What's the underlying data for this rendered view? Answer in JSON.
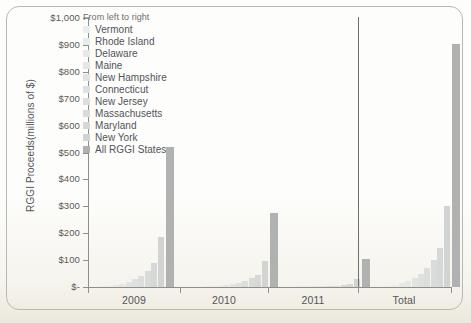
{
  "figure": {
    "frame_border_color": "#b9b9b4",
    "background_color": "#fdfdfb"
  },
  "legend": {
    "caption": "From left to right",
    "entries": [
      {
        "label": "Vermont",
        "color": "#eceded"
      },
      {
        "label": "Rhode Island",
        "color": "#eaebeb"
      },
      {
        "label": "Delaware",
        "color": "#e7e8e8"
      },
      {
        "label": "Maine",
        "color": "#e5e6e6"
      },
      {
        "label": "New Hampshire",
        "color": "#e2e3e3"
      },
      {
        "label": "Connecticut",
        "color": "#dfe0e0"
      },
      {
        "label": "New Jersey",
        "color": "#dcdddd"
      },
      {
        "label": "Massachusetts",
        "color": "#d9dada"
      },
      {
        "label": "Maryland",
        "color": "#d6d7d7"
      },
      {
        "label": "New York",
        "color": "#d2d3d3"
      },
      {
        "label": "All RGGI States",
        "color": "#b0b1b1"
      }
    ]
  },
  "axis": {
    "y_title": "RGGI Proceeds(millions of $)",
    "y_ticks": [
      "$1,000",
      "$900",
      "$800",
      "$700",
      "$600",
      "$500",
      "$400",
      "$300",
      "$200",
      "$100",
      "$-"
    ],
    "x_categories": [
      "2009",
      "2010",
      "2011",
      "Total"
    ]
  },
  "chart_data": {
    "type": "bar",
    "title": "",
    "xlabel": "",
    "ylabel": "RGGI Proceeds(millions of $)",
    "ylim": [
      0,
      1000
    ],
    "ytick_values": [
      0,
      100,
      200,
      300,
      400,
      500,
      600,
      700,
      800,
      900,
      1000
    ],
    "grid": false,
    "legend_position": "upper-left-inside",
    "legend_note": "From left to right",
    "categories": [
      "2009",
      "2010",
      "2011",
      "Total"
    ],
    "series": [
      {
        "name": "Vermont",
        "values": [
          2,
          1,
          0.5,
          3
        ]
      },
      {
        "name": "Rhode Island",
        "values": [
          4,
          2,
          1,
          7
        ]
      },
      {
        "name": "Delaware",
        "values": [
          8,
          4,
          1.5,
          14
        ]
      },
      {
        "name": "Maine",
        "values": [
          13,
          7,
          2,
          22
        ]
      },
      {
        "name": "New Hampshire",
        "values": [
          20,
          10,
          3,
          33
        ]
      },
      {
        "name": "Connecticut",
        "values": [
          30,
          16,
          4,
          50
        ]
      },
      {
        "name": "New Jersey",
        "values": [
          42,
          22,
          5,
          69
        ]
      },
      {
        "name": "Massachusetts",
        "values": [
          60,
          32,
          7,
          99
        ]
      },
      {
        "name": "Maryland",
        "values": [
          88,
          46,
          10,
          144
        ]
      },
      {
        "name": "New York",
        "values": [
          185,
          98,
          28,
          300
        ]
      },
      {
        "name": "All RGGI States",
        "values": [
          520,
          275,
          105,
          905
        ]
      }
    ]
  }
}
